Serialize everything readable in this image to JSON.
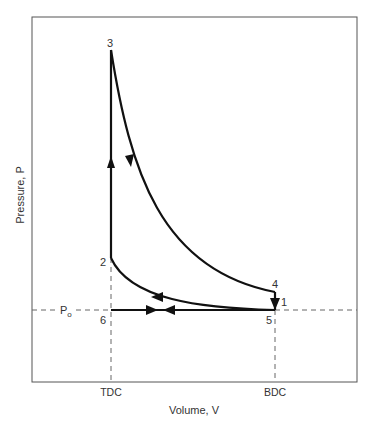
{
  "diagram": {
    "type": "pv-diagram",
    "ylabel": "Pressure, P",
    "xlabel": "Volume, V",
    "x_ticks": [
      {
        "label": "TDC",
        "x": 111
      },
      {
        "label": "BDC",
        "x": 275
      }
    ],
    "reference_line": {
      "label": "P",
      "subscript": "o"
    },
    "points": [
      {
        "label": "1",
        "x": 280,
        "y": 302
      },
      {
        "label": "2",
        "x": 104,
        "y": 262
      },
      {
        "label": "3",
        "x": 111,
        "y": 45
      },
      {
        "label": "4",
        "x": 276,
        "y": 287
      },
      {
        "label": "5",
        "x": 269,
        "y": 322
      },
      {
        "label": "6",
        "x": 104,
        "y": 322
      }
    ],
    "colors": {
      "curve": "#111111",
      "frame": "#555555",
      "dashed": "#666666",
      "text": "#333333"
    }
  }
}
